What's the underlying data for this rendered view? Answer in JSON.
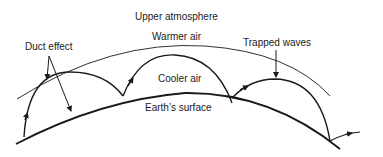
{
  "diagram": {
    "labels": {
      "upper_atmosphere": "Upper atmosphere",
      "warmer_air": "Warmer air",
      "duct_effect": "Duct effect",
      "trapped_waves": "Trapped waves",
      "cooler_air": "Cooler air",
      "earths_surface": "Earth’s surface"
    },
    "colors": {
      "line": "#1a1a1a",
      "background": "#ffffff"
    }
  }
}
